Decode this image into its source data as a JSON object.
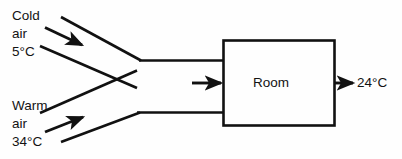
{
  "diagram": {
    "stroke_color": "#111111",
    "background_color": "#fefefe",
    "inlets": [
      {
        "id": "cold",
        "name_line_1": "Cold",
        "name_line_2": "air",
        "temperature": "5°C",
        "flow_direction": "down-right"
      },
      {
        "id": "warm",
        "name_line_1": "Warm",
        "name_line_2": "air",
        "temperature": "34°C",
        "flow_direction": "up-right"
      }
    ],
    "box": {
      "label": "Room"
    },
    "outlet": {
      "temperature": "24°C"
    }
  }
}
